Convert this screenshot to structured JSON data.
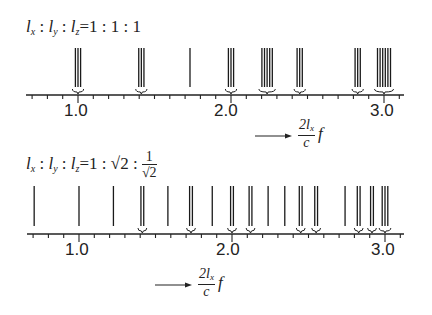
{
  "diagrams": [
    {
      "id": "cubic",
      "formula": {
        "lx": "l",
        "lx_sub": "x",
        "ly": "l",
        "ly_sub": "y",
        "lz": "l",
        "lz_sub": "z",
        "ratio": "=1 : 1 : 1"
      },
      "axis": {
        "tick_labels": [
          "1.0",
          "2.0",
          "3.0"
        ],
        "xlabel_num": "2l",
        "xlabel_num_sub": "x",
        "xlabel_den": "c",
        "xlabel_var": "f"
      },
      "line_groups": [
        {
          "center": 1.0,
          "count": 3,
          "brace": true
        },
        {
          "center": 1.414,
          "count": 3,
          "brace": true
        },
        {
          "center": 1.732,
          "count": 1,
          "brace": false
        },
        {
          "center": 2.0,
          "count": 3,
          "brace": true
        },
        {
          "center": 2.236,
          "count": 5,
          "brace": true
        },
        {
          "center": 2.449,
          "count": 3,
          "brace": true
        },
        {
          "center": 2.828,
          "count": 3,
          "brace": true
        },
        {
          "center": 3.0,
          "count": 6,
          "brace": true
        }
      ]
    },
    {
      "id": "rect",
      "formula": {
        "lx": "l",
        "lx_sub": "x",
        "ly": "l",
        "ly_sub": "y",
        "lz": "l",
        "lz_sub": "z",
        "ratio_prefix": "=1 : ",
        "sqrt2": "√2",
        "colon": " : ",
        "frac_num": "1",
        "frac_den": "√2"
      },
      "axis": {
        "tick_labels": [
          "1.0",
          "2.0",
          "3.0"
        ],
        "xlabel_num": "2l",
        "xlabel_num_sub": "x",
        "xlabel_den": "c",
        "xlabel_var": "f"
      },
      "line_groups": [
        {
          "center": 0.707,
          "count": 1,
          "brace": false
        },
        {
          "center": 1.0,
          "count": 1,
          "brace": false
        },
        {
          "center": 1.225,
          "count": 1,
          "brace": false
        },
        {
          "center": 1.414,
          "count": 2,
          "brace": true
        },
        {
          "center": 1.581,
          "count": 1,
          "brace": false
        },
        {
          "center": 1.732,
          "count": 2,
          "brace": true
        },
        {
          "center": 1.871,
          "count": 1,
          "brace": false
        },
        {
          "center": 2.0,
          "count": 2,
          "brace": true
        },
        {
          "center": 2.121,
          "count": 2,
          "brace": true
        },
        {
          "center": 2.236,
          "count": 1,
          "brace": false
        },
        {
          "center": 2.345,
          "count": 1,
          "brace": false
        },
        {
          "center": 2.449,
          "count": 2,
          "brace": true
        },
        {
          "center": 2.55,
          "count": 2,
          "brace": true
        },
        {
          "center": 2.739,
          "count": 1,
          "brace": false
        },
        {
          "center": 2.828,
          "count": 2,
          "brace": true
        },
        {
          "center": 2.915,
          "count": 2,
          "brace": true
        },
        {
          "center": 3.0,
          "count": 3,
          "brace": true
        }
      ]
    }
  ]
}
